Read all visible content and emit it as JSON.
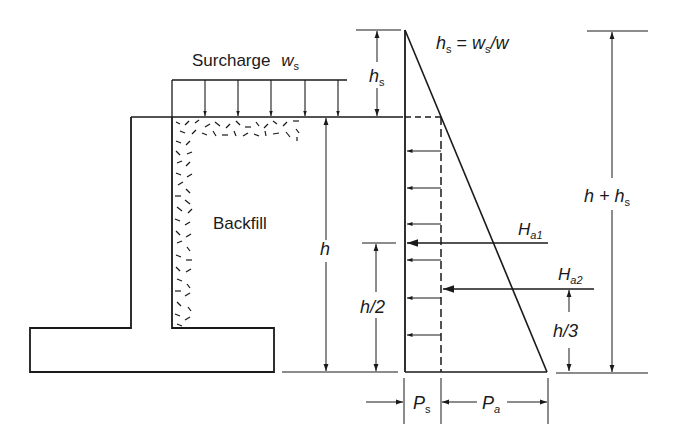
{
  "diagram": {
    "colors": {
      "ink": "#1a1a1a",
      "background": "#ffffff"
    },
    "labels": {
      "surcharge": "Surcharge",
      "surcharge_symbol": "w",
      "surcharge_sub": "s",
      "backfill": "Backfill",
      "h": "h",
      "hs_main": "h",
      "hs_sub": "s",
      "hs_formula_lhs": "h",
      "hs_formula_lhs_sub": "s",
      "hs_formula_eq": " = ",
      "hs_formula_w": "w",
      "hs_formula_w_sub": "s",
      "hs_formula_rest": "/w",
      "h_half": "h/2",
      "h_third": "h/3",
      "h_plus_hs_main": "h + h",
      "h_plus_hs_sub": "s",
      "Ha1_main": "H",
      "Ha1_sub": "a1",
      "Ha2_main": "H",
      "Ha2_sub": "a2",
      "Ps_main": "P",
      "Ps_sub": "s",
      "Pa_main": "P",
      "Pa_sub": "a"
    },
    "elements": [
      "retaining-wall-stem",
      "retaining-wall-footing",
      "backfill-hatch",
      "surcharge-load-arrows",
      "pressure-diagram-triangle",
      "surcharge-pressure-rectangle",
      "resultant-force-Ha1",
      "resultant-force-Ha2",
      "dimension-h",
      "dimension-hs",
      "dimension-h-half",
      "dimension-h-third",
      "dimension-h-plus-hs",
      "dimension-Ps",
      "dimension-Pa"
    ]
  }
}
